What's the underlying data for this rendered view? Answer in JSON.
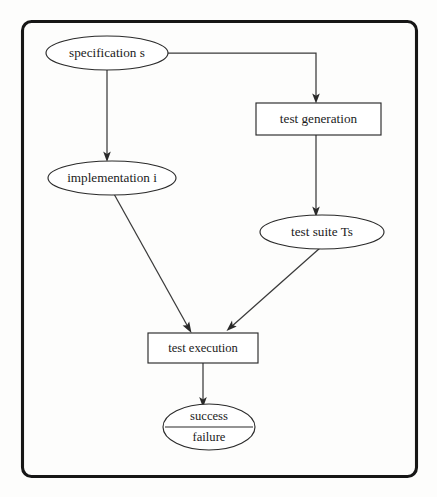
{
  "figure": {
    "kind": "flow-diagram",
    "title": "",
    "frame": {
      "label": "diagram-border"
    }
  },
  "nodes": [
    {
      "id": "specification",
      "label": "specification s",
      "shape": "ellipse",
      "cx": 107,
      "cy": 53,
      "rx": 61,
      "ry": 17
    },
    {
      "id": "test_generation",
      "label": "test generation",
      "shape": "rect",
      "x": 256,
      "y": 103,
      "w": 125,
      "h": 32
    },
    {
      "id": "implementation",
      "label": "implementation i",
      "shape": "ellipse",
      "cx": 112,
      "cy": 178,
      "rx": 64,
      "ry": 17
    },
    {
      "id": "test_suite",
      "label": "test suite Ts",
      "shape": "ellipse",
      "cx": 322,
      "cy": 232,
      "rx": 62,
      "ry": 17
    },
    {
      "id": "test_execution",
      "label": "test execution",
      "shape": "rect",
      "x": 148,
      "y": 333,
      "w": 110,
      "h": 30
    },
    {
      "id": "verdict",
      "label_top": "success",
      "label_bottom": "failure",
      "shape": "ellipse-split",
      "cx": 209,
      "cy": 427,
      "rx": 46,
      "ry": 23
    }
  ],
  "edges": [
    {
      "id": "spec-to-testgen",
      "from": "specification",
      "to": "test_generation",
      "style": "orthogonal",
      "arrow": true
    },
    {
      "id": "spec-to-impl",
      "from": "specification",
      "to": "implementation",
      "style": "straight-vertical",
      "arrow": true
    },
    {
      "id": "testgen-to-suite",
      "from": "test_generation",
      "to": "test_suite",
      "style": "straight-vertical",
      "arrow": true
    },
    {
      "id": "impl-to-exec",
      "from": "implementation",
      "to": "test_execution",
      "style": "diagonal",
      "arrow": true
    },
    {
      "id": "suite-to-exec",
      "from": "test_suite",
      "to": "test_execution",
      "style": "diagonal",
      "arrow": true
    },
    {
      "id": "exec-to-verdict",
      "from": "test_execution",
      "to": "verdict",
      "style": "straight-vertical",
      "arrow": true
    }
  ],
  "colors": {
    "background": "#fdfdfc",
    "frame_stroke": "#161616",
    "shape_stroke": "#2a2a2a",
    "edge_stroke": "#3a3a3a",
    "text": "#1b1b1b"
  }
}
